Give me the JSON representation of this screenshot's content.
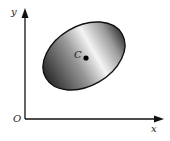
{
  "diagram": {
    "axes": {
      "x_label": "x",
      "y_label": "y",
      "origin_label": "O"
    },
    "ellipse": {
      "center": [
        84,
        56
      ],
      "rx": 44,
      "ry": 30,
      "rotation_deg": -30,
      "fill": "gradient-gray",
      "stroke": "#111111"
    },
    "point": {
      "label": "C",
      "position": [
        86,
        58
      ]
    },
    "colors": {
      "axis": "#111111",
      "ellipse_dark": "#2a2a2a",
      "ellipse_light": "#f4f4f4"
    }
  }
}
